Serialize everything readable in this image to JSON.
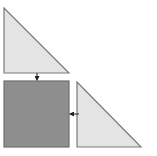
{
  "diagram": {
    "colors": {
      "triangle_fill": "#e4e4e4",
      "square_fill": "#8e8e8e",
      "stroke": "#7a7a7a",
      "arrow": "#222222",
      "background": "#ffffff"
    },
    "shapes": [
      {
        "id": "top-triangle",
        "type": "right-triangle",
        "points": [
          [
            4,
            8
          ],
          [
            4,
            73
          ],
          [
            69,
            73
          ]
        ]
      },
      {
        "id": "square",
        "type": "square",
        "x": 4,
        "y": 81,
        "width": 65,
        "height": 66
      },
      {
        "id": "right-triangle",
        "type": "right-triangle",
        "points": [
          [
            77,
            82
          ],
          [
            77,
            147
          ],
          [
            141,
            147
          ]
        ]
      }
    ],
    "arrows": [
      {
        "id": "arrow-down",
        "from": [
          37,
          73
        ],
        "to": [
          37,
          81
        ],
        "direction": "down"
      },
      {
        "id": "arrow-left",
        "from": [
          79,
          114
        ],
        "to": [
          69,
          114
        ],
        "direction": "left"
      }
    ]
  }
}
